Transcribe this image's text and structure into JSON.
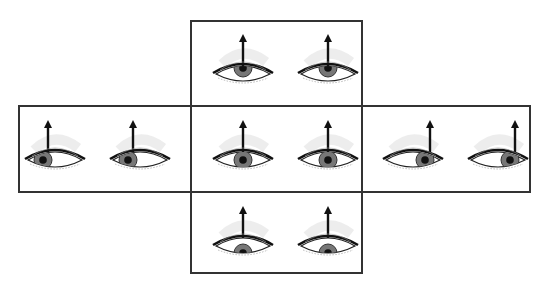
{
  "diagram": {
    "title": "",
    "colors": {
      "border": "#333333",
      "iris": "#777777",
      "pupil": "#111111",
      "arrow": "#111111",
      "shade": "#cccccc"
    },
    "panels": [
      {
        "id": "up",
        "gaze": "up",
        "eyes": [
          {
            "side": "left",
            "pupil_dx": 0,
            "pupil_dy": -6
          },
          {
            "side": "right",
            "pupil_dx": 0,
            "pupil_dy": -6
          }
        ]
      },
      {
        "id": "left",
        "gaze": "left",
        "eyes": [
          {
            "side": "left",
            "pupil_dx": -12,
            "pupil_dy": 0
          },
          {
            "side": "right",
            "pupil_dx": -12,
            "pupil_dy": 0
          }
        ]
      },
      {
        "id": "center",
        "gaze": "center",
        "eyes": [
          {
            "side": "left",
            "pupil_dx": 0,
            "pupil_dy": 0
          },
          {
            "side": "right",
            "pupil_dx": 0,
            "pupil_dy": 0
          }
        ]
      },
      {
        "id": "right",
        "gaze": "right",
        "eyes": [
          {
            "side": "left",
            "pupil_dx": 12,
            "pupil_dy": 0
          },
          {
            "side": "right",
            "pupil_dx": 12,
            "pupil_dy": 0
          }
        ]
      },
      {
        "id": "down",
        "gaze": "down",
        "eyes": [
          {
            "side": "left",
            "pupil_dx": 0,
            "pupil_dy": 7
          },
          {
            "side": "right",
            "pupil_dx": 0,
            "pupil_dy": 7
          }
        ]
      }
    ],
    "arrow_direction": "up"
  }
}
